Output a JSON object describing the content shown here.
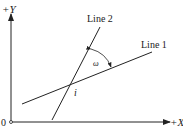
{
  "diagram": {
    "axes": {
      "y_label": "+Y",
      "x_label": "+X",
      "origin_label": "0"
    },
    "lines": [
      {
        "name": "Line 1",
        "label": "Line 1"
      },
      {
        "name": "Line 2",
        "label": "Line 2"
      }
    ],
    "intersection_label": "i",
    "angle_label": "ω",
    "colors": {
      "stroke": "#222222",
      "background": "#ffffff"
    }
  }
}
